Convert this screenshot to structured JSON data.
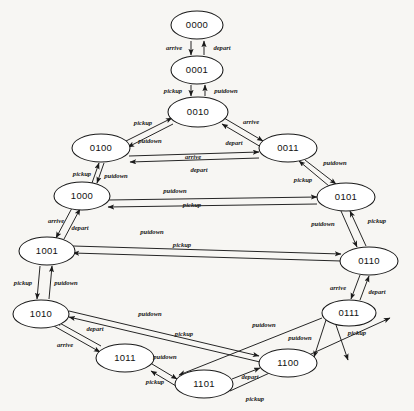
{
  "diagram": {
    "type": "directed-graph",
    "nodes": [
      {
        "id": "0000",
        "label": "0000",
        "cx": 197,
        "cy": 25,
        "rx": 26,
        "ry": 14
      },
      {
        "id": "0001",
        "label": "0001",
        "cx": 197,
        "cy": 70,
        "rx": 26,
        "ry": 14
      },
      {
        "id": "0010",
        "label": "0010",
        "cx": 198,
        "cy": 112,
        "rx": 30,
        "ry": 15
      },
      {
        "id": "0100",
        "label": "0100",
        "cx": 101,
        "cy": 148,
        "rx": 29,
        "ry": 14
      },
      {
        "id": "0011",
        "label": "0011",
        "cx": 288,
        "cy": 148,
        "rx": 29,
        "ry": 14
      },
      {
        "id": "1000",
        "label": "1000",
        "cx": 82,
        "cy": 196,
        "rx": 28,
        "ry": 14
      },
      {
        "id": "0101",
        "label": "0101",
        "cx": 346,
        "cy": 197,
        "rx": 29,
        "ry": 14
      },
      {
        "id": "1001",
        "label": "1001",
        "cx": 47,
        "cy": 251,
        "rx": 28,
        "ry": 14
      },
      {
        "id": "0110",
        "label": "0110",
        "cx": 369,
        "cy": 261,
        "rx": 29,
        "ry": 14
      },
      {
        "id": "1010",
        "label": "1010",
        "cx": 41,
        "cy": 314,
        "rx": 28,
        "ry": 14
      },
      {
        "id": "0111",
        "label": "0111",
        "cx": 349,
        "cy": 313,
        "rx": 27,
        "ry": 13
      },
      {
        "id": "1011",
        "label": "1011",
        "cx": 125,
        "cy": 358,
        "rx": 29,
        "ry": 14
      },
      {
        "id": "1100",
        "label": "1100",
        "cx": 288,
        "cy": 363,
        "rx": 29,
        "ry": 14
      },
      {
        "id": "1101",
        "label": "1101",
        "cx": 204,
        "cy": 384,
        "rx": 29,
        "ry": 14
      }
    ],
    "edge_action_labels": [
      "arrive",
      "depart",
      "pickup",
      "putdown"
    ],
    "edges": [
      {
        "from": "0000",
        "to": "0001",
        "label": "arrive",
        "x1": 191,
        "y1": 41,
        "x2": 191,
        "y2": 55,
        "lx": 174,
        "ly": 48
      },
      {
        "from": "0001",
        "to": "0000",
        "label": "depart",
        "x1": 204,
        "y1": 55,
        "x2": 204,
        "y2": 41,
        "lx": 222,
        "ly": 48
      },
      {
        "from": "0001",
        "to": "0010",
        "label": "pickup",
        "x1": 191,
        "y1": 85,
        "x2": 191,
        "y2": 96,
        "lx": 173,
        "ly": 91
      },
      {
        "from": "0010",
        "to": "0001",
        "label": "putdown",
        "x1": 205,
        "y1": 96,
        "x2": 205,
        "y2": 85,
        "lx": 226,
        "ly": 91
      },
      {
        "from": "0100",
        "to": "0010",
        "label": "pickup",
        "x1": 126,
        "y1": 141,
        "x2": 172,
        "y2": 118,
        "lx": 143,
        "ly": 123
      },
      {
        "from": "0010",
        "to": "0100",
        "label": "putdown",
        "x1": 173,
        "y1": 124,
        "x2": 128,
        "y2": 147,
        "lx": 150,
        "ly": 141
      },
      {
        "from": "0010",
        "to": "0011",
        "label": "arrive",
        "x1": 224,
        "y1": 118,
        "x2": 263,
        "y2": 141,
        "lx": 251,
        "ly": 122
      },
      {
        "from": "0011",
        "to": "0010",
        "label": "depart",
        "x1": 261,
        "y1": 147,
        "x2": 222,
        "y2": 124,
        "lx": 234,
        "ly": 143
      },
      {
        "from": "0100",
        "to": "0011",
        "label": "arrive",
        "x1": 129,
        "y1": 156,
        "x2": 259,
        "y2": 152,
        "lx": 193,
        "ly": 157
      },
      {
        "from": "0011",
        "to": "0100",
        "label": "depart",
        "x1": 259,
        "y1": 158,
        "x2": 130,
        "y2": 162,
        "lx": 199,
        "ly": 170
      },
      {
        "from": "1000",
        "to": "0100",
        "label": "pickup",
        "x1": 92,
        "y1": 183,
        "x2": 99,
        "y2": 163,
        "lx": 82,
        "ly": 174
      },
      {
        "from": "0100",
        "to": "1000",
        "label": "putdown",
        "x1": 104,
        "y1": 163,
        "x2": 97,
        "y2": 183,
        "lx": 116,
        "ly": 176
      },
      {
        "from": "1000",
        "to": "0101",
        "label": "putdown",
        "x1": 108,
        "y1": 200,
        "x2": 317,
        "y2": 197,
        "lx": 175,
        "ly": 191
      },
      {
        "from": "0101",
        "to": "1000",
        "label": "pickup",
        "x1": 317,
        "y1": 204,
        "x2": 108,
        "y2": 207,
        "lx": 192,
        "ly": 205
      },
      {
        "from": "0011",
        "to": "0101",
        "label": "putdown",
        "x1": 305,
        "y1": 160,
        "x2": 336,
        "y2": 184,
        "lx": 335,
        "ly": 163
      },
      {
        "from": "0101",
        "to": "0011",
        "label": "pickup",
        "x1": 329,
        "y1": 186,
        "x2": 299,
        "y2": 161,
        "lx": 303,
        "ly": 180
      },
      {
        "from": "1000",
        "to": "1001",
        "label": "arrive",
        "x1": 72,
        "y1": 208,
        "x2": 56,
        "y2": 238,
        "lx": 56,
        "ly": 221
      },
      {
        "from": "1001",
        "to": "1000",
        "label": "depart",
        "x1": 64,
        "y1": 239,
        "x2": 80,
        "y2": 209,
        "lx": 80,
        "ly": 228
      },
      {
        "from": "0101",
        "to": "0110",
        "label": "putdown",
        "x1": 341,
        "y1": 211,
        "x2": 357,
        "y2": 247,
        "lx": 323,
        "ly": 224
      },
      {
        "from": "0110",
        "to": "0101",
        "label": "pickup",
        "x1": 366,
        "y1": 246,
        "x2": 350,
        "y2": 211,
        "lx": 377,
        "ly": 221
      },
      {
        "from": "1001",
        "to": "0110",
        "label": "putdown",
        "x1": 73,
        "y1": 246,
        "x2": 341,
        "y2": 254,
        "lx": 152,
        "ly": 232
      },
      {
        "from": "0110",
        "to": "1001",
        "label": "pickup",
        "x1": 341,
        "y1": 261,
        "x2": 73,
        "y2": 253,
        "lx": 182,
        "ly": 245
      },
      {
        "from": "1001",
        "to": "1010",
        "label": "pickup",
        "x1": 40,
        "y1": 266,
        "x2": 37,
        "y2": 299,
        "lx": 23,
        "ly": 283
      },
      {
        "from": "1010",
        "to": "1001",
        "label": "putdown",
        "x1": 49,
        "y1": 299,
        "x2": 52,
        "y2": 266,
        "lx": 66,
        "ly": 283
      },
      {
        "from": "0110",
        "to": "0111",
        "label": "arrive",
        "x1": 360,
        "y1": 275,
        "x2": 351,
        "y2": 299,
        "lx": 338,
        "ly": 288
      },
      {
        "from": "0111",
        "to": "0110",
        "label": "depart",
        "x1": 360,
        "y1": 300,
        "x2": 369,
        "y2": 276,
        "lx": 377,
        "ly": 292
      },
      {
        "from": "1010",
        "to": "1100",
        "label": "putdown",
        "x1": 69,
        "y1": 311,
        "x2": 259,
        "y2": 356,
        "lx": 150,
        "ly": 314
      },
      {
        "from": "1100",
        "to": "1010",
        "label": "pickup",
        "x1": 260,
        "y1": 362,
        "x2": 69,
        "y2": 317,
        "lx": 184,
        "ly": 334
      },
      {
        "from": "1010",
        "to": "1011",
        "label": "arrive",
        "x1": 54,
        "y1": 326,
        "x2": 100,
        "y2": 352,
        "lx": 65,
        "ly": 345
      },
      {
        "from": "1011",
        "to": "1010",
        "label": "depart",
        "x1": 101,
        "y1": 346,
        "x2": 56,
        "y2": 321,
        "lx": 95,
        "ly": 329
      },
      {
        "from": "1011",
        "to": "1101",
        "label": "putdown",
        "x1": 152,
        "y1": 364,
        "x2": 177,
        "y2": 379,
        "lx": 165,
        "ly": 357
      },
      {
        "from": "1101",
        "to": "1011",
        "label": "pickup",
        "x1": 176,
        "y1": 386,
        "x2": 151,
        "y2": 371,
        "lx": 155,
        "ly": 382
      },
      {
        "from": "1101",
        "to": "1100",
        "label": "depart",
        "x1": 232,
        "y1": 379,
        "x2": 260,
        "y2": 368,
        "lx": 250,
        "ly": 377
      },
      {
        "from": "0111",
        "to": "1100",
        "label": "putdown",
        "x1": 326,
        "y1": 320,
        "x2": 314,
        "y2": 357,
        "lx": 300,
        "ly": 338
      },
      {
        "from": "1100",
        "to": "0111",
        "label": "pickup",
        "x1": 336,
        "y1": 325,
        "x2": 348,
        "y2": 360,
        "lx": 357,
        "ly": 333
      },
      {
        "from": "0111",
        "to": "1101",
        "label": "putdown",
        "x1": 322,
        "y1": 318,
        "x2": 179,
        "y2": 375,
        "lx": 264,
        "ly": 325
      },
      {
        "from": "1101",
        "to": "0111",
        "label": "pickup",
        "x1": 230,
        "y1": 391,
        "x2": 390,
        "y2": 318,
        "lx": 255,
        "ly": 399
      }
    ]
  }
}
